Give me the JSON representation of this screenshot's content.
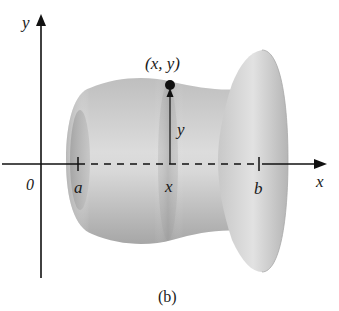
{
  "figure": {
    "caption": "(b)",
    "colors": {
      "surface_light": "#e6e6e6",
      "surface_mid": "#bdbdbd",
      "surface_dark": "#8f8f8f",
      "axis": "#111111",
      "background": "#ffffff"
    }
  },
  "axes": {
    "x_label": "x",
    "y_label": "y",
    "origin_label": "0"
  },
  "ticks": {
    "a_label": "a",
    "x_label": "x",
    "b_label": "b"
  },
  "point": {
    "label": "(x, y)",
    "radius_label": "y"
  }
}
